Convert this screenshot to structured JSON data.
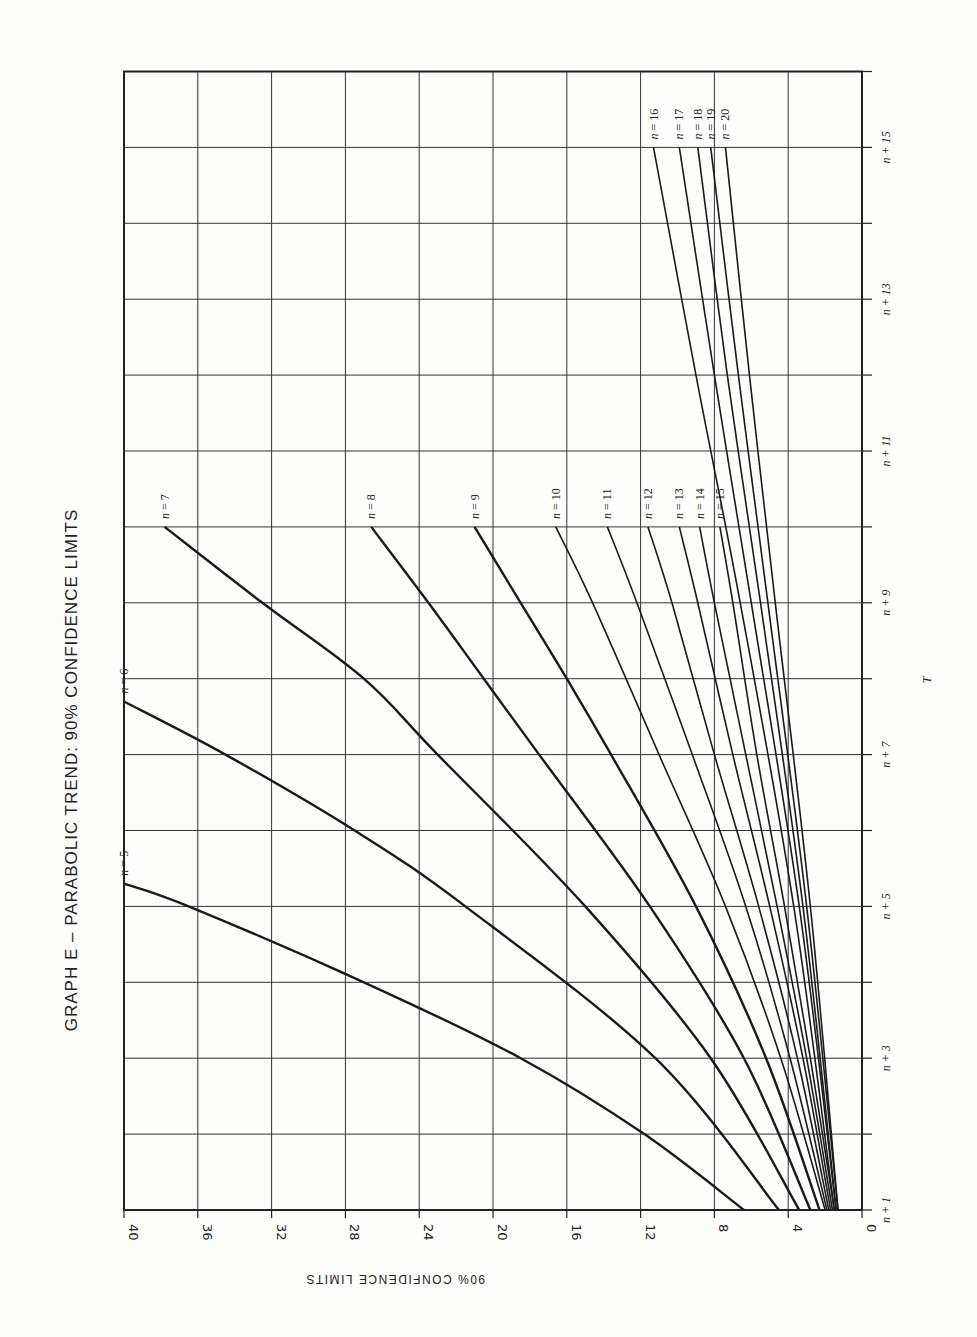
{
  "chart_data": {
    "type": "line",
    "title": "GRAPH E – PARABOLIC TREND: 90% CONFIDENCE LIMITS",
    "xlabel": "T",
    "ylabel": "90% CONFIDENCE LIMITS",
    "orientation": "rotated 90° (page turned sideways): T axis runs along right edge bottom→top, limits axis runs along bottom edge right→left",
    "grid": true,
    "x_ticks": [
      "n + 1",
      "n + 3",
      "n + 5",
      "n + 7",
      "n + 9",
      "n + 11",
      "n + 13",
      "n + 15"
    ],
    "x_range_offsets": [
      1,
      16
    ],
    "y_ticks": [
      0,
      4,
      8,
      12,
      16,
      20,
      24,
      28,
      32,
      36,
      40
    ],
    "ylim": [
      0,
      40
    ],
    "series": [
      {
        "name": "n = 5",
        "points": [
          [
            1,
            6.4
          ],
          [
            2,
            11.8
          ],
          [
            3,
            18.5
          ],
          [
            4,
            27.0
          ],
          [
            5,
            36.5
          ],
          [
            5.3,
            40.0
          ]
        ]
      },
      {
        "name": "n = 6",
        "points": [
          [
            1,
            4.5
          ],
          [
            3,
            11.2
          ],
          [
            5,
            21.5
          ],
          [
            6,
            27.5
          ],
          [
            7,
            34.5
          ],
          [
            7.7,
            40.0
          ]
        ]
      },
      {
        "name": "n = 7",
        "points": [
          [
            1,
            3.4
          ],
          [
            3,
            8.2
          ],
          [
            5,
            15.0
          ],
          [
            7,
            23.0
          ],
          [
            8,
            27.0
          ],
          [
            9,
            32.5
          ],
          [
            10,
            37.8
          ]
        ]
      },
      {
        "name": "n = 8",
        "points": [
          [
            1,
            2.8
          ],
          [
            3,
            6.4
          ],
          [
            5,
            11.5
          ],
          [
            7,
            17.5
          ],
          [
            8,
            20.5
          ],
          [
            9,
            23.5
          ],
          [
            10,
            26.6
          ]
        ]
      },
      {
        "name": "n = 9",
        "points": [
          [
            1,
            2.3
          ],
          [
            3,
            5.2
          ],
          [
            5,
            9.0
          ],
          [
            7,
            13.6
          ],
          [
            8,
            16.0
          ],
          [
            9,
            18.5
          ],
          [
            10,
            21.0
          ]
        ]
      },
      {
        "name": "n = 10",
        "points": [
          [
            1,
            2.0
          ],
          [
            3,
            4.4
          ],
          [
            5,
            7.4
          ],
          [
            7,
            11.0
          ],
          [
            9,
            14.6
          ],
          [
            10,
            16.6
          ]
        ]
      },
      {
        "name": "n = 11",
        "points": [
          [
            1,
            1.9
          ],
          [
            3,
            3.9
          ],
          [
            5,
            6.3
          ],
          [
            7,
            9.2
          ],
          [
            9,
            12.2
          ],
          [
            10,
            13.8
          ]
        ]
      },
      {
        "name": "n = 12",
        "points": [
          [
            1,
            1.8
          ],
          [
            3,
            3.5
          ],
          [
            5,
            5.6
          ],
          [
            7,
            8.0
          ],
          [
            9,
            10.3
          ],
          [
            10,
            11.6
          ]
        ]
      },
      {
        "name": "n = 13",
        "points": [
          [
            1,
            1.7
          ],
          [
            3,
            3.2
          ],
          [
            5,
            5.0
          ],
          [
            7,
            7.0
          ],
          [
            9,
            8.9
          ],
          [
            10,
            9.9
          ]
        ]
      },
      {
        "name": "n = 14",
        "points": [
          [
            1,
            1.6
          ],
          [
            3,
            3.0
          ],
          [
            5,
            4.6
          ],
          [
            7,
            6.3
          ],
          [
            9,
            8.0
          ],
          [
            10,
            8.8
          ]
        ]
      },
      {
        "name": "n = 15",
        "points": [
          [
            1,
            1.5
          ],
          [
            3,
            2.8
          ],
          [
            5,
            4.2
          ],
          [
            7,
            5.7
          ],
          [
            9,
            7.0
          ],
          [
            10,
            7.7
          ]
        ]
      },
      {
        "name": "n = 16",
        "points": [
          [
            1,
            1.5
          ],
          [
            5,
            3.7
          ],
          [
            9,
            6.6
          ],
          [
            12,
            9.0
          ],
          [
            15,
            11.3
          ]
        ]
      },
      {
        "name": "n = 17",
        "points": [
          [
            1,
            1.4
          ],
          [
            5,
            3.4
          ],
          [
            9,
            6.0
          ],
          [
            12,
            8.0
          ],
          [
            15,
            9.9
          ]
        ]
      },
      {
        "name": "n = 18",
        "points": [
          [
            1,
            1.4
          ],
          [
            5,
            3.2
          ],
          [
            9,
            5.5
          ],
          [
            12,
            7.3
          ],
          [
            15,
            8.9
          ]
        ]
      },
      {
        "name": "n = 19",
        "points": [
          [
            1,
            1.3
          ],
          [
            5,
            3.0
          ],
          [
            9,
            5.1
          ],
          [
            12,
            6.7
          ],
          [
            15,
            8.2
          ]
        ]
      },
      {
        "name": "n = 20",
        "points": [
          [
            1,
            1.3
          ],
          [
            5,
            2.8
          ],
          [
            9,
            4.7
          ],
          [
            12,
            6.1
          ],
          [
            15,
            7.4
          ]
        ]
      }
    ]
  },
  "labels": {
    "title": "GRAPH E – PARABOLIC TREND: 90% CONFIDENCE LIMITS",
    "ylabel": "90% CONFIDENCE LIMITS",
    "xlabel": "T"
  }
}
